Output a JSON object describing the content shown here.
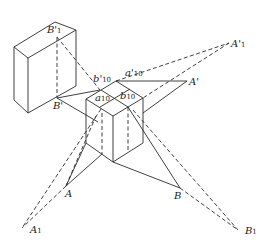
{
  "figure": {
    "type": "perspective shadow construction diagram",
    "labels": {
      "B1_prime": {
        "base": "B'",
        "sub": "1"
      },
      "b10_prime": {
        "base": "b'",
        "sub": "10"
      },
      "a10_prime": {
        "base": "a'",
        "sub": "10"
      },
      "A1_prime": {
        "base": "A'",
        "sub": "1"
      },
      "a10": {
        "base": "a",
        "sub": "10"
      },
      "b10": {
        "base": "b",
        "sub": "10"
      },
      "A_prime": {
        "base": "A'",
        "sub": ""
      },
      "B_prime": {
        "base": "B'",
        "sub": ""
      },
      "A": {
        "base": "A",
        "sub": ""
      },
      "B": {
        "base": "B",
        "sub": ""
      },
      "A1": {
        "base": "A",
        "sub": "1"
      },
      "B1": {
        "base": "B",
        "sub": "1"
      }
    },
    "line_styles": {
      "solid": "object edges and construction lines",
      "dashed": "projection / shadow rays"
    },
    "stroke_color": "#2a2a2a"
  }
}
